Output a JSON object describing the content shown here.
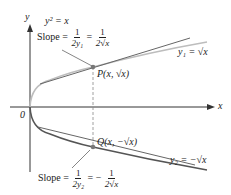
{
  "diagram": {
    "equation": "y² = x",
    "axis_x_label": "x",
    "axis_y_label": "y",
    "origin_label": "0",
    "upper": {
      "slope_prefix": "Slope =",
      "frac1_num": "1",
      "frac1_den": "2y₁",
      "frac2_num": "1",
      "frac2_den": "2√x",
      "point_label": "P(x, √x)",
      "curve_label": "y₁ = √x"
    },
    "lower": {
      "slope_prefix": "Slope =",
      "frac1_num": "1",
      "frac1_den": "2y₂",
      "frac2_sign": "−",
      "frac2_num": "1",
      "frac2_den": "2√x",
      "point_label": "Q(x, −√x)",
      "curve_label": "y₂ = −√x"
    },
    "colors": {
      "upper_curve": "#bdbdbd",
      "lower_curve": "#555555",
      "tangent": "#666666",
      "axis": "#333333",
      "point": "#777777"
    }
  }
}
